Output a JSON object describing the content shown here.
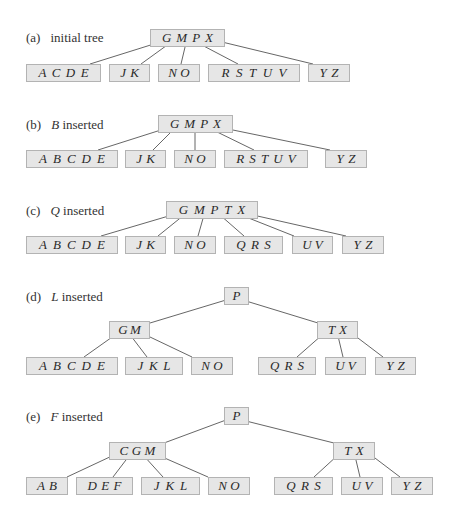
{
  "figure": {
    "colors": {
      "node_fill": "#e6e6e6",
      "node_border": "#b3b3b3",
      "edge": "#555555",
      "text": "#2a2a2a"
    },
    "panels": [
      {
        "id": "a",
        "tag": "(a)",
        "caption_key": "",
        "caption_rest": "initial tree",
        "label_pos": [
          26,
          30
        ],
        "nodes": [
          {
            "keys": [
              "G",
              "M",
              "P",
              "X"
            ],
            "x": 150,
            "y": 29,
            "w": 75
          },
          {
            "keys": [
              "A",
              "C",
              "D",
              "E"
            ],
            "x": 26,
            "y": 64,
            "w": 75
          },
          {
            "keys": [
              "J",
              "K"
            ],
            "x": 109,
            "y": 64,
            "w": 41
          },
          {
            "keys": [
              "N",
              "O"
            ],
            "x": 158,
            "y": 64,
            "w": 42
          },
          {
            "keys": [
              "R",
              "S",
              "T",
              "U",
              "V"
            ],
            "x": 208,
            "y": 64,
            "w": 92
          },
          {
            "keys": [
              "Y",
              "Z"
            ],
            "x": 308,
            "y": 64,
            "w": 42
          }
        ],
        "edges": [
          [
            157,
            43,
            90,
            64
          ],
          [
            170,
            43,
            141,
            64
          ],
          [
            186,
            43,
            181,
            64
          ],
          [
            198,
            43,
            238,
            64
          ],
          [
            222,
            42,
            313,
            64
          ]
        ]
      },
      {
        "id": "b",
        "tag": "(b)",
        "caption_key": "B",
        "caption_rest": " inserted",
        "label_pos": [
          26,
          117
        ],
        "nodes": [
          {
            "keys": [
              "G",
              "M",
              "P",
              "X"
            ],
            "x": 158,
            "y": 115,
            "w": 75
          },
          {
            "keys": [
              "A",
              "B",
              "C",
              "D",
              "E"
            ],
            "x": 26,
            "y": 150,
            "w": 92
          },
          {
            "keys": [
              "J",
              "K"
            ],
            "x": 125,
            "y": 150,
            "w": 41
          },
          {
            "keys": [
              "N",
              "O"
            ],
            "x": 174,
            "y": 150,
            "w": 42
          },
          {
            "keys": [
              "R",
              "S",
              "T",
              "U",
              "V"
            ],
            "x": 224,
            "y": 150,
            "w": 84
          },
          {
            "keys": [
              "Y",
              "Z"
            ],
            "x": 325,
            "y": 150,
            "w": 42
          }
        ],
        "edges": [
          [
            164,
            129,
            98,
            150
          ],
          [
            174,
            129,
            153,
            150
          ],
          [
            195,
            129,
            195,
            150
          ],
          [
            211,
            129,
            254,
            150
          ],
          [
            228,
            129,
            330,
            150
          ]
        ]
      },
      {
        "id": "c",
        "tag": "(c)",
        "caption_key": "Q",
        "caption_rest": " inserted",
        "label_pos": [
          26,
          203
        ],
        "nodes": [
          {
            "keys": [
              "G",
              "M",
              "P",
              "T",
              "X"
            ],
            "x": 166,
            "y": 201,
            "w": 92
          },
          {
            "keys": [
              "A",
              "B",
              "C",
              "D",
              "E"
            ],
            "x": 26,
            "y": 236,
            "w": 92
          },
          {
            "keys": [
              "J",
              "K"
            ],
            "x": 125,
            "y": 236,
            "w": 41
          },
          {
            "keys": [
              "N",
              "O"
            ],
            "x": 174,
            "y": 236,
            "w": 42
          },
          {
            "keys": [
              "Q",
              "R",
              "S"
            ],
            "x": 224,
            "y": 236,
            "w": 59
          },
          {
            "keys": [
              "U",
              "V"
            ],
            "x": 292,
            "y": 236,
            "w": 41
          },
          {
            "keys": [
              "Y",
              "Z"
            ],
            "x": 342,
            "y": 236,
            "w": 42
          }
        ],
        "edges": [
          [
            172,
            215,
            101,
            236
          ],
          [
            184,
            215,
            158,
            236
          ],
          [
            204,
            215,
            198,
            236
          ],
          [
            220,
            215,
            244,
            236
          ],
          [
            241,
            215,
            294,
            236
          ],
          [
            253,
            215,
            346,
            236
          ]
        ]
      },
      {
        "id": "d",
        "tag": "(d)",
        "caption_key": "L",
        "caption_rest": " inserted",
        "label_pos": [
          26,
          289
        ],
        "nodes": [
          {
            "keys": [
              "P"
            ],
            "x": 224,
            "y": 287,
            "w": 25
          },
          {
            "keys": [
              "G",
              "M"
            ],
            "x": 109,
            "y": 321,
            "w": 41
          },
          {
            "keys": [
              "T",
              "X"
            ],
            "x": 317,
            "y": 321,
            "w": 41
          },
          {
            "keys": [
              "A",
              "B",
              "C",
              "D",
              "E"
            ],
            "x": 26,
            "y": 357,
            "w": 92
          },
          {
            "keys": [
              "J",
              "K",
              "L"
            ],
            "x": 125,
            "y": 357,
            "w": 58
          },
          {
            "keys": [
              "N",
              "O"
            ],
            "x": 191,
            "y": 357,
            "w": 42
          },
          {
            "keys": [
              "Q",
              "R",
              "S"
            ],
            "x": 258,
            "y": 357,
            "w": 58
          },
          {
            "keys": [
              "U",
              "V"
            ],
            "x": 325,
            "y": 357,
            "w": 41
          },
          {
            "keys": [
              "Y",
              "Z"
            ],
            "x": 375,
            "y": 357,
            "w": 41
          }
        ],
        "edges": [
          [
            226,
            300,
            150,
            323
          ],
          [
            246,
            301,
            318,
            323
          ],
          [
            115,
            335,
            84,
            357
          ],
          [
            131,
            336,
            147,
            357
          ],
          [
            150,
            337,
            192,
            357
          ],
          [
            322,
            335,
            297,
            357
          ],
          [
            338,
            336,
            343,
            357
          ],
          [
            354,
            335,
            383,
            357
          ]
        ]
      },
      {
        "id": "e",
        "tag": "(e)",
        "caption_key": "F",
        "caption_rest": " inserted",
        "label_pos": [
          26,
          409
        ],
        "nodes": [
          {
            "keys": [
              "P"
            ],
            "x": 224,
            "y": 407,
            "w": 25
          },
          {
            "keys": [
              "C",
              "G",
              "M"
            ],
            "x": 109,
            "y": 442,
            "w": 57
          },
          {
            "keys": [
              "T",
              "X"
            ],
            "x": 333,
            "y": 442,
            "w": 42
          },
          {
            "keys": [
              "A",
              "B"
            ],
            "x": 26,
            "y": 477,
            "w": 42
          },
          {
            "keys": [
              "D",
              "E",
              "F"
            ],
            "x": 76,
            "y": 477,
            "w": 57
          },
          {
            "keys": [
              "J",
              "K",
              "L"
            ],
            "x": 141,
            "y": 477,
            "w": 59
          },
          {
            "keys": [
              "N",
              "O"
            ],
            "x": 208,
            "y": 477,
            "w": 42
          },
          {
            "keys": [
              "Q",
              "R",
              "S"
            ],
            "x": 274,
            "y": 477,
            "w": 59
          },
          {
            "keys": [
              "U",
              "V"
            ],
            "x": 341,
            "y": 477,
            "w": 42
          },
          {
            "keys": [
              "Y",
              "Z"
            ],
            "x": 391,
            "y": 477,
            "w": 42
          }
        ],
        "edges": [
          [
            226,
            420,
            164,
            443
          ],
          [
            246,
            421,
            334,
            443
          ],
          [
            114,
            455,
            67,
            477
          ],
          [
            129,
            456,
            113,
            477
          ],
          [
            144,
            456,
            163,
            477
          ],
          [
            160,
            456,
            208,
            477
          ],
          [
            338,
            455,
            314,
            477
          ],
          [
            355,
            456,
            360,
            477
          ],
          [
            371,
            455,
            400,
            477
          ]
        ]
      }
    ]
  }
}
